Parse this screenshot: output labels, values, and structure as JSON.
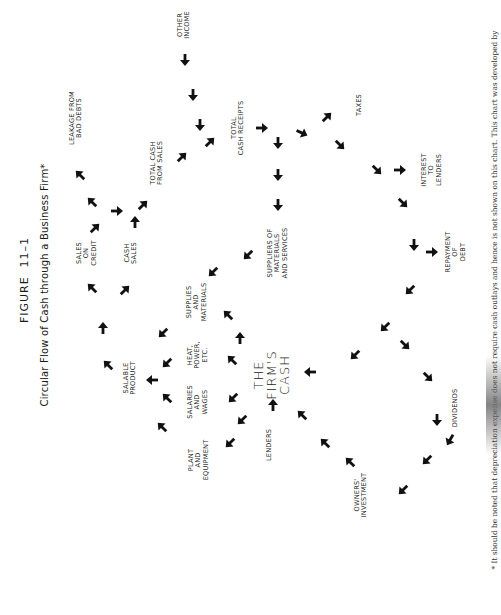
{
  "figure": {
    "number": "FIGURE  11–1",
    "title": "Circular Flow of Cash through a Business Firm*",
    "footnote": "* It should be noted that depreciation expense does not require cash outlays and hence is not shown on this chart. This chart was developed by"
  },
  "nodes": {
    "leakage_bad_debts": "LEAKAGE FROM\nBAD DEBTS",
    "sales_on_credit": "SALES\nON\nCREDIT",
    "cash_sales": "CASH\nSALES",
    "total_cash_from_sales": "TOTAL CASH\nFROM SALES",
    "other_income": "OTHER\nINCOME",
    "total_cash_receipts": "TOTAL\nCASH RECEIPTS",
    "taxes": "TAXES",
    "interest_to_lenders": "INTEREST\nTO\nLENDERS",
    "suppliers": "SUPPLIERS OF\nMATERIALS\nAND SERVICES",
    "repayment_of_debt": "REPAYMENT\nOF\nDEBT",
    "supplies_and_materials": "SUPPLIES\nAND\nMATERIALS",
    "heat_power": "HEAT,\nPOWER,\nETC.",
    "salable_product": "SALABLE\nPRODUCT",
    "firms_cash": "THE\nFIRM'S\nCASH",
    "salaries_and_wages": "SALARIES\nAND\nWAGES",
    "plant_and_equipment": "PLANT\nAND\nEQUIPMENT",
    "lenders": "LENDERS",
    "dividends": "DIVIDENDS",
    "owners_investment": "OWNERS'\nINVESTMENT"
  },
  "arrows": [
    {
      "x": 185,
      "y": 60,
      "dir": "down"
    },
    {
      "x": 193,
      "y": 95,
      "dir": "down"
    },
    {
      "x": 200,
      "y": 125,
      "dir": "down"
    },
    {
      "x": 210,
      "y": 142,
      "dir": "up-right"
    },
    {
      "x": 182,
      "y": 157,
      "dir": "up-right"
    },
    {
      "x": 143,
      "y": 205,
      "dir": "up-right"
    },
    {
      "x": 135,
      "y": 222,
      "dir": "up"
    },
    {
      "x": 117,
      "y": 211,
      "dir": "right"
    },
    {
      "x": 95,
      "y": 228,
      "dir": "up-right"
    },
    {
      "x": 92,
      "y": 202,
      "dir": "up-left"
    },
    {
      "x": 80,
      "y": 175,
      "dir": "up-left"
    },
    {
      "x": 92,
      "y": 288,
      "dir": "up-left"
    },
    {
      "x": 125,
      "y": 290,
      "dir": "up-right"
    },
    {
      "x": 103,
      "y": 328,
      "dir": "up"
    },
    {
      "x": 108,
      "y": 365,
      "dir": "up-left"
    },
    {
      "x": 152,
      "y": 380,
      "dir": "left"
    },
    {
      "x": 163,
      "y": 333,
      "dir": "down-left"
    },
    {
      "x": 167,
      "y": 363,
      "dir": "down-left"
    },
    {
      "x": 167,
      "y": 398,
      "dir": "up-left"
    },
    {
      "x": 162,
      "y": 427,
      "dir": "up-left"
    },
    {
      "x": 262,
      "y": 128,
      "dir": "right"
    },
    {
      "x": 278,
      "y": 143,
      "dir": "down"
    },
    {
      "x": 278,
      "y": 175,
      "dir": "down"
    },
    {
      "x": 278,
      "y": 205,
      "dir": "down"
    },
    {
      "x": 302,
      "y": 133,
      "dir": "right-down"
    },
    {
      "x": 327,
      "y": 117,
      "dir": "up-right"
    },
    {
      "x": 340,
      "y": 145,
      "dir": "down-right"
    },
    {
      "x": 377,
      "y": 170,
      "dir": "down-right"
    },
    {
      "x": 400,
      "y": 170,
      "dir": "right"
    },
    {
      "x": 403,
      "y": 203,
      "dir": "down-right"
    },
    {
      "x": 414,
      "y": 245,
      "dir": "down"
    },
    {
      "x": 432,
      "y": 252,
      "dir": "right"
    },
    {
      "x": 410,
      "y": 290,
      "dir": "down-left"
    },
    {
      "x": 385,
      "y": 327,
      "dir": "down-left"
    },
    {
      "x": 405,
      "y": 345,
      "dir": "down-right"
    },
    {
      "x": 428,
      "y": 377,
      "dir": "down-right"
    },
    {
      "x": 437,
      "y": 420,
      "dir": "down"
    },
    {
      "x": 450,
      "y": 440,
      "dir": "curve"
    },
    {
      "x": 427,
      "y": 460,
      "dir": "down-left"
    },
    {
      "x": 403,
      "y": 490,
      "dir": "down-left"
    },
    {
      "x": 355,
      "y": 355,
      "dir": "down-left"
    },
    {
      "x": 310,
      "y": 372,
      "dir": "left"
    },
    {
      "x": 248,
      "y": 255,
      "dir": "down-left"
    },
    {
      "x": 213,
      "y": 272,
      "dir": "down-left"
    },
    {
      "x": 228,
      "y": 315,
      "dir": "up-left"
    },
    {
      "x": 240,
      "y": 338,
      "dir": "up"
    },
    {
      "x": 232,
      "y": 360,
      "dir": "up-left"
    },
    {
      "x": 233,
      "y": 398,
      "dir": "down-left"
    },
    {
      "x": 242,
      "y": 420,
      "dir": "down-left"
    },
    {
      "x": 230,
      "y": 443,
      "dir": "down-left"
    },
    {
      "x": 273,
      "y": 405,
      "dir": "up"
    },
    {
      "x": 302,
      "y": 415,
      "dir": "up-left"
    },
    {
      "x": 325,
      "y": 443,
      "dir": "up-left"
    },
    {
      "x": 350,
      "y": 462,
      "dir": "up-left"
    }
  ]
}
